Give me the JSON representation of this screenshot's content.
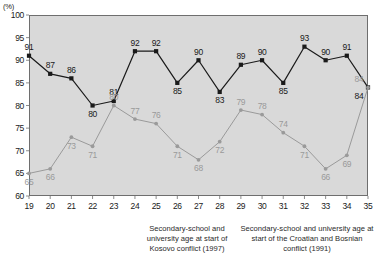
{
  "chart": {
    "axis_unit_label": "(%)",
    "yticks": [
      60,
      65,
      70,
      75,
      80,
      85,
      90,
      95,
      100
    ],
    "xticks": [
      19,
      20,
      21,
      22,
      23,
      24,
      25,
      26,
      27,
      28,
      29,
      30,
      31,
      32,
      33,
      34,
      35
    ],
    "caption_left": "Secondary-school and university age at start of Kosovo conflict (1997)",
    "caption_right": "Secondary-school and university age at start of the Croatian and Bosnian conflict (1991)",
    "colors": {
      "plot_background": "#d9d9d9",
      "frame": "#6e6e6e",
      "series_dark": "#1a1a1a",
      "series_gray": "#9a9a9a",
      "page_background": "#ffffff"
    }
  },
  "chart_data": {
    "type": "line",
    "title": "",
    "xlabel": "",
    "ylabel": "(%)",
    "ylim": [
      60,
      100
    ],
    "xlim": [
      19,
      35
    ],
    "grid": false,
    "legend_position": "none",
    "categories": [
      19,
      20,
      21,
      22,
      23,
      24,
      25,
      26,
      27,
      28,
      29,
      30,
      31,
      32,
      33,
      34,
      35
    ],
    "series": [
      {
        "name": "dark",
        "color": "#1a1a1a",
        "marker": "square",
        "values": [
          91,
          87,
          86,
          80,
          81,
          92,
          92,
          85,
          90,
          83,
          89,
          90,
          85,
          93,
          90,
          91,
          84
        ]
      },
      {
        "name": "gray",
        "color": "#9a9a9a",
        "marker": "circle",
        "values": [
          65,
          66,
          73,
          71,
          80,
          77,
          76,
          71,
          68,
          72,
          79,
          78,
          74,
          71,
          66,
          69,
          84
        ]
      }
    ],
    "annotations": [
      "Secondary-school and university age at start of Kosovo conflict (1997)",
      "Secondary-school and university age at start of the Croatian and Bosnian conflict (1991)"
    ]
  }
}
